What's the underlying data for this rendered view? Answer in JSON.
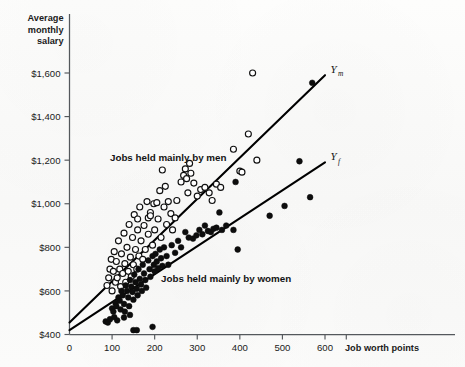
{
  "chart_data": {
    "type": "scatter",
    "title": "",
    "xlabel": "Job worth points",
    "ylabel": "Average monthly salary",
    "ylabel_lines": [
      "Average",
      "monthly",
      "salary"
    ],
    "xlim": [
      0,
      660
    ],
    "ylim": [
      400,
      1700
    ],
    "xticks": [
      0,
      100,
      200,
      300,
      400,
      500,
      600
    ],
    "xticklabels": [
      "0",
      "100",
      "200",
      "300",
      "400",
      "500",
      "600"
    ],
    "yticks": [
      400,
      600,
      800,
      1000,
      1200,
      1400,
      1600
    ],
    "yticklabels": [
      "$400",
      "$600",
      "$800",
      "$1,000",
      "$1,200",
      "$1,400",
      "$1,600"
    ],
    "grid": false,
    "legend_position": "inline-annotations",
    "annotations": [
      {
        "text": "Jobs held mainly by men",
        "x": 95,
        "y": 1195
      },
      {
        "text": "Jobs held mainly by women",
        "x": 215,
        "y": 640
      }
    ],
    "series": [
      {
        "name": "Jobs held mainly by men",
        "marker": "open-circle",
        "color": "#ffffff",
        "edge_color": "#101010",
        "points": [
          [
            88,
            625
          ],
          [
            92,
            660
          ],
          [
            95,
            700
          ],
          [
            98,
            745
          ],
          [
            100,
            600
          ],
          [
            103,
            690
          ],
          [
            105,
            780
          ],
          [
            108,
            640
          ],
          [
            110,
            735
          ],
          [
            112,
            660
          ],
          [
            115,
            830
          ],
          [
            118,
            700
          ],
          [
            120,
            620
          ],
          [
            122,
            770
          ],
          [
            125,
            680
          ],
          [
            128,
            865
          ],
          [
            130,
            725
          ],
          [
            132,
            640
          ],
          [
            135,
            800
          ],
          [
            138,
            690
          ],
          [
            140,
            905
          ],
          [
            143,
            755
          ],
          [
            145,
            665
          ],
          [
            148,
            845
          ],
          [
            150,
            720
          ],
          [
            152,
            950
          ],
          [
            155,
            790
          ],
          [
            158,
            700
          ],
          [
            160,
            880
          ],
          [
            163,
            760
          ],
          [
            165,
            985
          ],
          [
            168,
            830
          ],
          [
            172,
            745
          ],
          [
            175,
            900
          ],
          [
            178,
            790
          ],
          [
            182,
            1010
          ],
          [
            185,
            860
          ],
          [
            190,
            960
          ],
          [
            195,
            810
          ],
          [
            198,
            1000
          ],
          [
            200,
            880
          ],
          [
            205,
            1005
          ],
          [
            208,
            930
          ],
          [
            212,
            1060
          ],
          [
            215,
            845
          ],
          [
            218,
            1155
          ],
          [
            222,
            985
          ],
          [
            225,
            1080
          ],
          [
            228,
            905
          ],
          [
            232,
            1010
          ],
          [
            238,
            955
          ],
          [
            242,
            880
          ],
          [
            248,
            935
          ],
          [
            252,
            1015
          ],
          [
            262,
            1100
          ],
          [
            268,
            1130
          ],
          [
            272,
            1160
          ],
          [
            275,
            1115
          ],
          [
            278,
            1050
          ],
          [
            282,
            1185
          ],
          [
            285,
            1140
          ],
          [
            292,
            1095
          ],
          [
            300,
            1035
          ],
          [
            308,
            1065
          ],
          [
            318,
            1075
          ],
          [
            328,
            1050
          ],
          [
            335,
            1015
          ],
          [
            345,
            1090
          ],
          [
            355,
            1075
          ],
          [
            385,
            1250
          ],
          [
            400,
            1150
          ],
          [
            405,
            1145
          ],
          [
            420,
            1320
          ],
          [
            430,
            1600
          ],
          [
            440,
            1200
          ],
          [
            200,
            700
          ],
          [
            160,
            930
          ],
          [
            185,
            935
          ],
          [
            190,
            945
          ]
        ]
      },
      {
        "name": "Jobs held mainly by women",
        "marker": "filled-circle",
        "color": "#0d0d0d",
        "edge_color": "#0d0d0d",
        "points": [
          [
            85,
            460
          ],
          [
            90,
            455
          ],
          [
            95,
            470
          ],
          [
            100,
            520
          ],
          [
            103,
            505
          ],
          [
            105,
            480
          ],
          [
            108,
            545
          ],
          [
            110,
            530
          ],
          [
            112,
            465
          ],
          [
            115,
            570
          ],
          [
            118,
            555
          ],
          [
            120,
            515
          ],
          [
            122,
            600
          ],
          [
            125,
            580
          ],
          [
            128,
            540
          ],
          [
            130,
            505
          ],
          [
            132,
            625
          ],
          [
            135,
            600
          ],
          [
            138,
            570
          ],
          [
            140,
            530
          ],
          [
            142,
            650
          ],
          [
            145,
            620
          ],
          [
            148,
            595
          ],
          [
            150,
            560
          ],
          [
            152,
            675
          ],
          [
            155,
            640
          ],
          [
            158,
            610
          ],
          [
            160,
            580
          ],
          [
            162,
            700
          ],
          [
            165,
            655
          ],
          [
            168,
            630
          ],
          [
            170,
            600
          ],
          [
            172,
            720
          ],
          [
            175,
            680
          ],
          [
            178,
            650
          ],
          [
            180,
            615
          ],
          [
            185,
            740
          ],
          [
            188,
            700
          ],
          [
            190,
            665
          ],
          [
            195,
            760
          ],
          [
            198,
            720
          ],
          [
            200,
            690
          ],
          [
            202,
            770
          ],
          [
            205,
            735
          ],
          [
            208,
            705
          ],
          [
            212,
            790
          ],
          [
            215,
            750
          ],
          [
            218,
            715
          ],
          [
            222,
            800
          ],
          [
            228,
            760
          ],
          [
            232,
            720
          ],
          [
            240,
            810
          ],
          [
            248,
            775
          ],
          [
            255,
            830
          ],
          [
            262,
            800
          ],
          [
            272,
            870
          ],
          [
            280,
            845
          ],
          [
            290,
            840
          ],
          [
            298,
            855
          ],
          [
            305,
            880
          ],
          [
            312,
            860
          ],
          [
            318,
            900
          ],
          [
            325,
            875
          ],
          [
            332,
            870
          ],
          [
            338,
            885
          ],
          [
            345,
            890
          ],
          [
            352,
            960
          ],
          [
            358,
            880
          ],
          [
            368,
            900
          ],
          [
            385,
            880
          ],
          [
            390,
            1100
          ],
          [
            395,
            790
          ],
          [
            470,
            945
          ],
          [
            505,
            990
          ],
          [
            540,
            1195
          ],
          [
            565,
            1030
          ],
          [
            570,
            1555
          ],
          [
            150,
            420
          ],
          [
            158,
            420
          ],
          [
            195,
            435
          ],
          [
            128,
            478
          ],
          [
            142,
            490
          ]
        ]
      }
    ],
    "fit_lines": [
      {
        "name": "Ym",
        "label": "Y",
        "subscript": "m",
        "x0": 0,
        "y0": 455,
        "x1": 600,
        "y1": 1590
      },
      {
        "name": "Yf",
        "label": "Y",
        "subscript": "f",
        "x0": 0,
        "y0": 420,
        "x1": 600,
        "y1": 1190
      }
    ]
  }
}
